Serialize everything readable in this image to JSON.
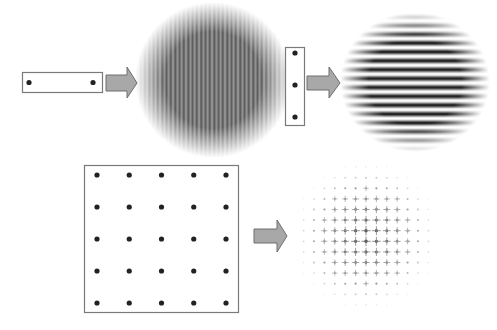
{
  "diagram": {
    "colors": {
      "background": "#ffffff",
      "box_stroke": "#7a7a7a",
      "pinhole": "#222222",
      "arrow_fill": "#a8a8a8",
      "arrow_stroke": "#6e6e6e",
      "fringe": "#111111"
    },
    "panels": [
      {
        "id": "horizontal-pair",
        "aperture": {
          "type": "slit-box",
          "orientation": "horizontal",
          "pinholes": 2,
          "rows": 1,
          "cols": 2
        },
        "pattern": {
          "type": "fringes",
          "fringe_orientation": "vertical",
          "fringe_count": 36
        }
      },
      {
        "id": "vertical-triple",
        "aperture": {
          "type": "slit-box",
          "orientation": "vertical",
          "pinholes": 3,
          "rows": 3,
          "cols": 1
        },
        "pattern": {
          "type": "fringes",
          "fringe_orientation": "horizontal",
          "fringe_count": 16
        }
      },
      {
        "id": "grid-5x5",
        "aperture": {
          "type": "grid-box",
          "pinholes": 25,
          "rows": 5,
          "cols": 5
        },
        "pattern": {
          "type": "dot-lattice",
          "lattice_rows": 14,
          "lattice_cols": 13
        }
      }
    ],
    "arrows": [
      {
        "from": "horizontal-pair aperture",
        "to": "vertical fringes",
        "direction": "right"
      },
      {
        "from": "vertical-triple aperture",
        "to": "horizontal fringes",
        "direction": "right"
      },
      {
        "from": "5x5 grid aperture",
        "to": "dot pattern",
        "direction": "right"
      }
    ]
  }
}
